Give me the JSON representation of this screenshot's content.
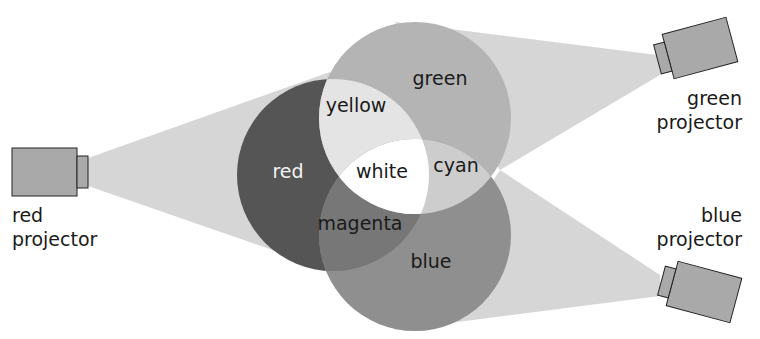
{
  "diagram": {
    "regions": {
      "red": "red",
      "green": "green",
      "blue": "blue",
      "yellow": "yellow",
      "cyan": "cyan",
      "magenta": "magenta",
      "white": "white"
    },
    "projectors": {
      "red": {
        "line1": "red",
        "line2": "projector"
      },
      "green": {
        "line1": "green",
        "line2": "projector"
      },
      "blue": {
        "line1": "blue",
        "line2": "projector"
      }
    },
    "colors": {
      "red_circle": "#555555",
      "green_circle": "#b4b4b4",
      "blue_circle": "#8f8f8f",
      "yellow_overlap": "#e4e4e4",
      "cyan_overlap": "#cdcdcd",
      "magenta_overlap": "#777777",
      "white_overlap": "#ffffff",
      "beam": "#d6d6d6",
      "projector_body": "#a9a9a9",
      "projector_outline": "#222222"
    }
  }
}
